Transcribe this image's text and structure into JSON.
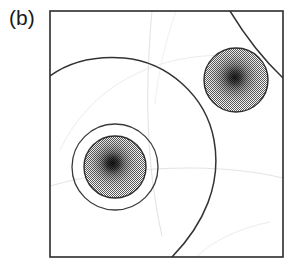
{
  "figure": {
    "panel_label": "(b)",
    "caption_visible": false,
    "background_color": "#ffffff",
    "frame": {
      "name": "plot-frame",
      "x": 50,
      "y": 11,
      "width": 233,
      "height": 246,
      "stroke_color": "#2b2b2b",
      "stroke_width": 1.6,
      "fill": "#ffffff"
    }
  },
  "chart_data": {
    "type": "heatmap",
    "title": "(b)",
    "xlabel": "",
    "ylabel": "",
    "xlim": [
      0,
      233
    ],
    "ylim": [
      0,
      246
    ],
    "grid": false,
    "legend": "none",
    "blobs": [
      {
        "name": "blob-lower-left",
        "cx": 115,
        "cy": 167,
        "radius": 31,
        "peak_value": 1.0,
        "edge_value": 0.35,
        "center_color": "#1e1e1e",
        "edge_color": "#9a9a9a",
        "has_outer_ring": true,
        "outer_ring_radius": 43,
        "outer_ring_color": "#3a3a3a"
      },
      {
        "name": "blob-upper-right",
        "cx": 236,
        "cy": 80,
        "radius": 32,
        "peak_value": 0.92,
        "edge_value": 0.35,
        "center_color": "#242424",
        "edge_color": "#9a9a9a",
        "has_outer_ring": false,
        "outer_ring_radius": 0,
        "outer_ring_color": ""
      }
    ],
    "contours": [
      {
        "name": "contour-major-arc",
        "level": 0.15,
        "stroke_color": "#333333",
        "stroke_width": 1.5,
        "path": "M 50,76 C 72,60 98,56 124,58 C 168,62 206,96 214,140 C 222,184 204,224 172,257"
      },
      {
        "name": "contour-corner-arc",
        "level": 0.15,
        "stroke_color": "#333333",
        "stroke_width": 1.5,
        "path": "M 230,11 C 244,34 262,58 283,78"
      },
      {
        "name": "contour-inner-ring-lower-left",
        "level": 0.3,
        "stroke_color": "#3a3a3a",
        "stroke_width": 1.3,
        "path": "circle"
      },
      {
        "name": "contour-faint-vertical",
        "level": 0.05,
        "stroke_color": "#e2e2e2",
        "stroke_width": 1.0,
        "path": "M 152,11 C 149,44 147,80 148,118 C 149,160 154,200 162,236"
      },
      {
        "name": "contour-faint-horizontal",
        "level": 0.05,
        "stroke_color": "#e4e4e4",
        "stroke_width": 1.0,
        "path": "M 50,186 C 92,174 140,168 190,168 C 226,168 258,172 283,178"
      },
      {
        "name": "contour-faint-upper",
        "level": 0.05,
        "stroke_color": "#ececec",
        "stroke_width": 1.0,
        "path": "M 60,150 C 76,116 104,88 140,72 C 176,56 216,52 252,58"
      },
      {
        "name": "contour-faint-lower-right",
        "level": 0.05,
        "stroke_color": "#ececec",
        "stroke_width": 1.0,
        "path": "M 196,257 C 214,240 240,228 270,222"
      }
    ],
    "stipple": {
      "name": "dither-checkerboard",
      "cell_px": 2,
      "light_color": "#ffffff",
      "dark_color": "#555555"
    }
  }
}
